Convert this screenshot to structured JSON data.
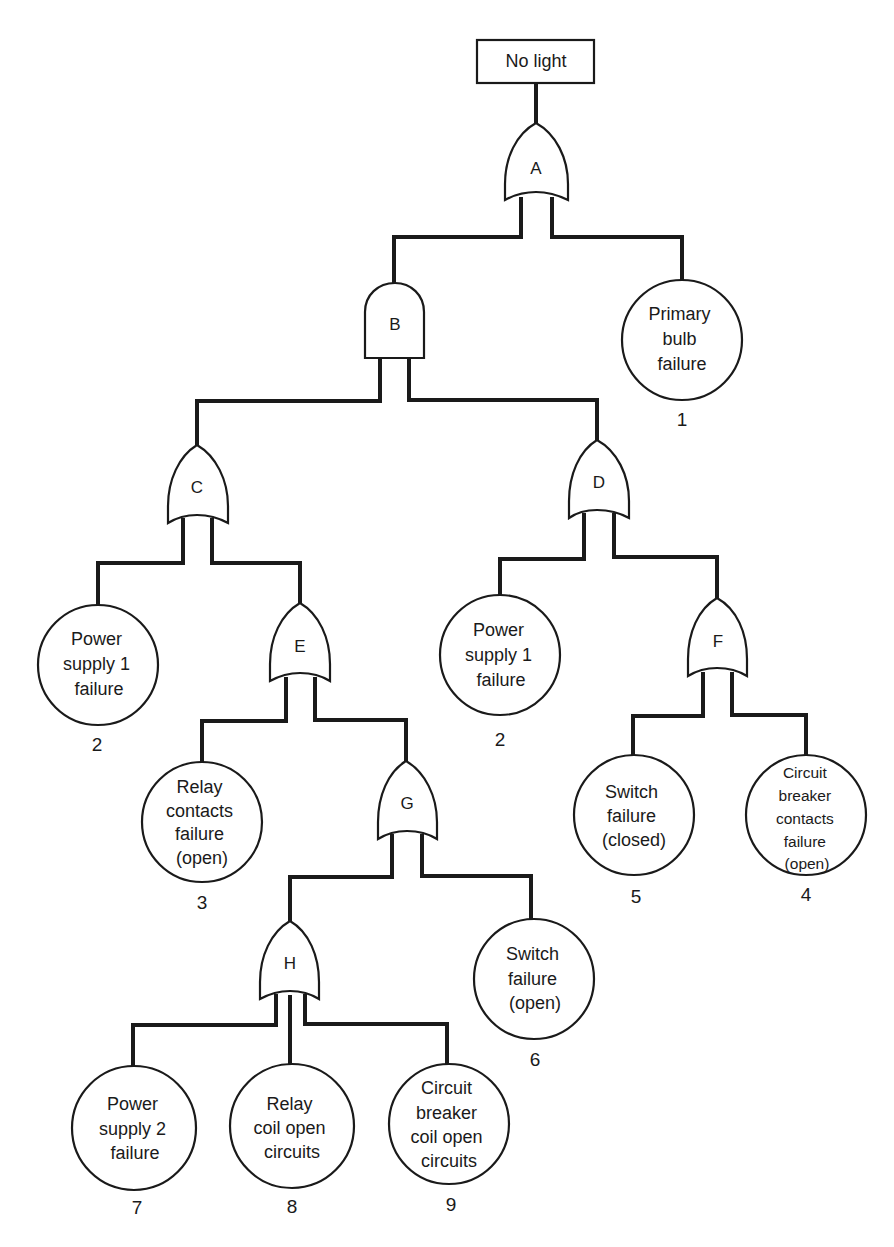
{
  "diagram": {
    "type": "fault-tree",
    "top_event": {
      "id": "top",
      "label": "No light"
    },
    "gates": [
      {
        "id": "A",
        "label": "A",
        "type": "OR",
        "output_to": "top"
      },
      {
        "id": "B",
        "label": "B",
        "type": "AND",
        "output_to": "A"
      },
      {
        "id": "C",
        "label": "C",
        "type": "OR",
        "output_to": "B"
      },
      {
        "id": "D",
        "label": "D",
        "type": "OR",
        "output_to": "B"
      },
      {
        "id": "E",
        "label": "E",
        "type": "OR",
        "output_to": "C"
      },
      {
        "id": "F",
        "label": "F",
        "type": "OR",
        "output_to": "D"
      },
      {
        "id": "G",
        "label": "G",
        "type": "OR",
        "output_to": "E"
      },
      {
        "id": "H",
        "label": "H",
        "type": "OR",
        "output_to": "G"
      }
    ],
    "basic_events": [
      {
        "key": "e1",
        "number": "1",
        "lines": [
          "Primary",
          "bulb",
          "failure"
        ],
        "parent": "A"
      },
      {
        "key": "e2a",
        "number": "2",
        "lines": [
          "Power",
          "supply 1",
          "failure"
        ],
        "parent": "C"
      },
      {
        "key": "e2b",
        "number": "2",
        "lines": [
          "Power",
          "supply 1",
          "failure"
        ],
        "parent": "D"
      },
      {
        "key": "e3",
        "number": "3",
        "lines": [
          "Relay",
          "contacts",
          "failure",
          "(open)"
        ],
        "parent": "E"
      },
      {
        "key": "e5",
        "number": "5",
        "lines": [
          "Switch",
          "failure",
          "(closed)"
        ],
        "parent": "F"
      },
      {
        "key": "e4",
        "number": "4",
        "lines": [
          "Circuit",
          "breaker",
          "contacts",
          "failure",
          "(open)"
        ],
        "parent": "F"
      },
      {
        "key": "e6",
        "number": "6",
        "lines": [
          "Switch",
          "failure",
          "(open)"
        ],
        "parent": "G"
      },
      {
        "key": "e7",
        "number": "7",
        "lines": [
          "Power",
          "supply 2",
          "failure"
        ],
        "parent": "H"
      },
      {
        "key": "e8",
        "number": "8",
        "lines": [
          "Relay",
          "coil open",
          "circuits"
        ],
        "parent": "H"
      },
      {
        "key": "e9",
        "number": "9",
        "lines": [
          "Circuit",
          "breaker",
          "coil open",
          "circuits"
        ],
        "parent": "H"
      }
    ]
  }
}
